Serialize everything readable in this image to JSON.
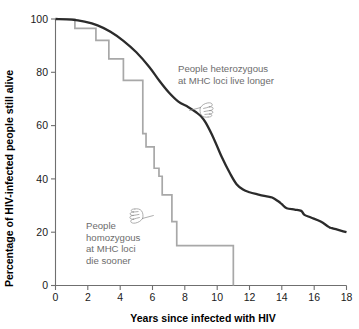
{
  "chart_data": {
    "type": "line",
    "title": "",
    "subtitle": "",
    "xlabel": "Years since infected with HIV",
    "ylabel": "Percentage of HIV-infected people still alive",
    "xlim": [
      0,
      18
    ],
    "ylim": [
      0,
      100
    ],
    "grid": false,
    "legend_position": "none",
    "xticks": [
      0,
      2,
      4,
      6,
      8,
      10,
      12,
      14,
      16,
      18
    ],
    "xtick_labels": [
      "0",
      "2",
      "4",
      "6",
      "8",
      "10",
      "12",
      "14",
      "16",
      "18"
    ],
    "yticks": [
      0,
      20,
      40,
      60,
      80,
      100
    ],
    "ytick_labels": [
      "0",
      "20",
      "40",
      "60",
      "80",
      "100"
    ],
    "series": [
      {
        "name": "People heterozygous at MHC loci",
        "style": "smooth-curve",
        "color": "#2b2b2b",
        "x": [
          0.0,
          1.0,
          1.8,
          2.6,
          3.4,
          4.2,
          5.0,
          5.8,
          6.4,
          7.0,
          7.6,
          8.2,
          8.7,
          9.0,
          9.3,
          9.8,
          10.3,
          10.8,
          11.2,
          11.6,
          12.0,
          12.5,
          13.0,
          13.4,
          13.8,
          14.0,
          14.3,
          14.8,
          15.2,
          15.4,
          15.8,
          16.4,
          16.9,
          17.1,
          18.0
        ],
        "y": [
          100.0,
          99.8,
          99.0,
          97.6,
          95.2,
          91.8,
          87.5,
          82.0,
          77.0,
          72.5,
          69.0,
          67.0,
          65.0,
          63.5,
          61.0,
          55.0,
          48.0,
          42.0,
          38.0,
          36.0,
          35.0,
          34.2,
          33.5,
          33.0,
          31.5,
          30.5,
          29.0,
          28.5,
          28.0,
          26.5,
          25.5,
          24.0,
          22.0,
          21.5,
          20.0
        ]
      },
      {
        "name": "People homozygous at MHC loci",
        "style": "step-post",
        "color": "#a8a8a8",
        "x": [
          0.0,
          1.2,
          1.2,
          2.5,
          2.5,
          3.3,
          3.3,
          4.2,
          4.2,
          5.4,
          5.4,
          5.6,
          5.6,
          6.1,
          6.1,
          6.4,
          6.4,
          6.6,
          6.6,
          7.2,
          7.2,
          7.5,
          7.5,
          11.0,
          11.0
        ],
        "y": [
          100.0,
          100.0,
          96.5,
          96.5,
          92.0,
          92.0,
          85.0,
          85.0,
          77.0,
          77.0,
          57.0,
          57.0,
          52.0,
          52.0,
          44.0,
          44.0,
          41.0,
          41.0,
          34.0,
          34.0,
          24.0,
          24.0,
          15.0,
          15.0,
          0.0
        ]
      }
    ],
    "annotations": [
      {
        "id": "heterozygous-note",
        "lines": [
          "People heterozygous",
          "at MHC loci live longer"
        ],
        "color": "#6d6d6d",
        "icon": "pointing-hand-left-icon"
      },
      {
        "id": "homozygous-note",
        "lines": [
          "People",
          "homozygous",
          "at MHC loci",
          "die sooner"
        ],
        "color": "#6d6d6d",
        "icon": "pointing-hand-right-icon"
      }
    ]
  },
  "colors": {
    "heterozygous_line": "#2b2b2b",
    "homozygous_line": "#a8a8a8",
    "axis": "#6f6f6f",
    "annotation_text": "#6d6d6d",
    "tick_text": "#1a1a1a",
    "background": "#ffffff"
  }
}
